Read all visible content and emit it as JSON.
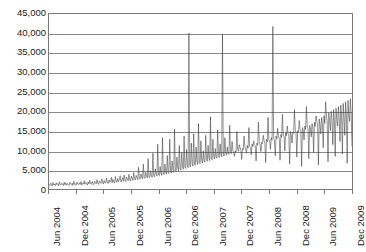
{
  "chart_data": {
    "type": "line",
    "title": "",
    "subtitle": "",
    "xlabel": "",
    "ylabel": "",
    "grid": true,
    "legend": false,
    "legend_position": "none",
    "series_color": "#3a3a3a",
    "gridline_color": "#8a8a8a",
    "axis_color": "#7a7a7a",
    "background": "#ffffff",
    "ylim": [
      0,
      45000
    ],
    "ytick_values": [
      45000,
      40000,
      35000,
      30000,
      25000,
      20000,
      15000,
      10000,
      5000,
      0
    ],
    "ytick_labels": [
      "45,000",
      "40,000",
      "35,000",
      "30,000",
      "25,000",
      "20,000",
      "15,000",
      "10,000",
      "5,000",
      "0"
    ],
    "xtick_labels": [
      "Jun 2004",
      "Dec 2004",
      "Jun 2005",
      "Dec 2005",
      "Jun 2006",
      "Dec 2006",
      "Jun 2007",
      "Dec 2007",
      "Jun 2008",
      "Dec 2008",
      "Jun 2009",
      "Dec 2009"
    ],
    "x_start": "Jun 2004",
    "x_end": "Dec 2009",
    "x_interval_months": 6,
    "series": [
      {
        "name": "series-1",
        "description": "Dense high-frequency (daily) time series, low baseline 2004-2005 rising sharply from 2006 with large intermittent spikes, high volatility 2008-2009.",
        "values": [
          1200,
          900,
          1500,
          1100,
          800,
          1700,
          1000,
          1300,
          900,
          1600,
          1100,
          1400,
          800,
          1900,
          1200,
          1000,
          1500,
          1300,
          900,
          1800,
          1100,
          1600,
          1000,
          1400,
          1200,
          900,
          1700,
          1300,
          1100,
          1500,
          900,
          2000,
          1200,
          1400,
          1000,
          1800,
          1300,
          1100,
          1600,
          1200,
          1900,
          1000,
          1500,
          1300,
          2100,
          1200,
          1700,
          1400,
          1000,
          1800,
          1300,
          2200,
          1500,
          1200,
          1900,
          1400,
          1100,
          2000,
          1600,
          1300,
          2400,
          1500,
          1200,
          2100,
          1700,
          1400,
          2600,
          1800,
          1300,
          2200,
          1600,
          1500,
          2800,
          1900,
          1400,
          2300,
          1700,
          2000,
          3000,
          1600,
          2500,
          1800,
          1500,
          3200,
          2100,
          1700,
          2700,
          1900,
          2400,
          3400,
          1800,
          2200,
          2900,
          2000,
          3600,
          2300,
          1900,
          3100,
          2500,
          2100,
          3800,
          2400,
          2000,
          3300,
          2700,
          2200,
          4200,
          2600,
          2300,
          3500,
          2900,
          2400,
          5600,
          2700,
          2500,
          3900,
          3100,
          2600,
          6400,
          2900,
          2700,
          4300,
          3300,
          2800,
          7800,
          3100,
          2900,
          4700,
          3500,
          3000,
          9200,
          3400,
          3100,
          5200,
          3800,
          3300,
          11500,
          3600,
          3400,
          5800,
          4100,
          3500,
          13200,
          3900,
          3700,
          6400,
          4400,
          3800,
          8600,
          4200,
          4000,
          12800,
          4600,
          4100,
          7200,
          5000,
          4300,
          15400,
          4800,
          4500,
          8200,
          5400,
          4700,
          11200,
          5200,
          4900,
          9400,
          5800,
          5100,
          13600,
          5600,
          5300,
          10200,
          6200,
          5500,
          40100,
          6000,
          5700,
          11800,
          6600,
          5900,
          14200,
          6400,
          6100,
          10800,
          7000,
          6300,
          16800,
          6800,
          6500,
          12400,
          7400,
          6700,
          9800,
          7200,
          6900,
          13800,
          7600,
          7100,
          11200,
          8000,
          7300,
          18600,
          7800,
          7500,
          12800,
          8400,
          7700,
          10400,
          8200,
          7900,
          15200,
          8600,
          8100,
          11600,
          9000,
          8300,
          39800,
          8800,
          8500,
          13200,
          9400,
          8700,
          10800,
          9200,
          8900,
          16400,
          9600,
          9100,
          12200,
          10000,
          9300,
          8400,
          9800,
          9500,
          14800,
          10200,
          9700,
          11400,
          10600,
          9900,
          7600,
          10400,
          10100,
          13600,
          10800,
          10300,
          9200,
          11200,
          10500,
          15800,
          11000,
          10700,
          8800,
          11600,
          10900,
          12400,
          11400,
          11100,
          7200,
          11800,
          11300,
          17200,
          12200,
          11500,
          9600,
          12000,
          11700,
          13800,
          12400,
          11900,
          6800,
          12800,
          12100,
          18400,
          12600,
          12300,
          10200,
          13200,
          12500,
          41800,
          13000,
          12700,
          8600,
          13600,
          12900,
          15600,
          13400,
          13100,
          7400,
          14000,
          13300,
          19200,
          13800,
          13500,
          9800,
          14400,
          13700,
          16200,
          14200,
          13900,
          6400,
          14800,
          14100,
          11800,
          14600,
          14300,
          20400,
          15200,
          14500,
          8200,
          15000,
          14700,
          17600,
          15400,
          14900,
          5800,
          15800,
          15100,
          12600,
          16200,
          15300,
          21200,
          16000,
          15500,
          7800,
          16400,
          15700,
          13400,
          16800,
          15900,
          9400,
          17200,
          16100,
          18800,
          17600,
          16300,
          6200,
          18000,
          16500,
          14200,
          18400,
          16700,
          10600,
          18800,
          16900,
          22400,
          19200,
          17100,
          7000,
          19600,
          17300,
          15000,
          20000,
          17500,
          11400,
          20400,
          17700,
          8400,
          20800,
          17900,
          16200,
          21200,
          18100,
          12200,
          21600,
          18300,
          9000,
          22000,
          18500,
          13800,
          22400,
          18700,
          6600,
          22800,
          18900,
          17400,
          23200,
          19100,
          11000
        ]
      }
    ],
    "notable_peaks": [
      {
        "approx_date": "Mar 2007",
        "value": 40100
      },
      {
        "approx_date": "Feb 2008",
        "value": 39800
      },
      {
        "approx_date": "Oct 2008",
        "value": 41800
      },
      {
        "approx_date": "Nov 2009",
        "value": 22800
      }
    ]
  }
}
